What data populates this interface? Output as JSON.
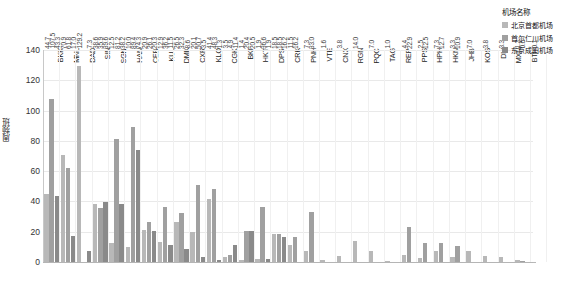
{
  "chart_data": {
    "type": "bar",
    "title": "",
    "xlabel": "",
    "ylabel": "周频班",
    "ylim": [
      0,
      140
    ],
    "yticks": [
      0,
      20,
      40,
      60,
      80,
      100,
      120,
      140
    ],
    "grid": true,
    "legend_position": "top-right",
    "legend_title": "机场名称",
    "categories": [
      "BKK",
      "MNL",
      "DAD",
      "SIN",
      "SGN",
      "HAN",
      "CEB",
      "KUL",
      "DMK",
      "CXR",
      "KLO",
      "CGK",
      "BKI",
      "HKT",
      "DPS",
      "CRK",
      "PNH",
      "VTE",
      "CNX",
      "RGN",
      "PQC",
      "TAG",
      "REP",
      "PPS",
      "HPH",
      "HKN",
      "JHB",
      "KOS",
      "DLI",
      "MXN",
      "BTH"
    ],
    "series": [
      {
        "name": "北京首都机场",
        "color": "#b8b8b8",
        "values": [
          44.7,
          70.9,
          129.2,
          38.6,
          12.5,
          10.0,
          20.9,
          12.9,
          26.5,
          20.1,
          41.4,
          3.5,
          1.4,
          1.9,
          18.5,
          11.5,
          7.3,
          1.6,
          3.8,
          14.0,
          7.0,
          1.0,
          4.4,
          2.5,
          7.3,
          3.3,
          7.0,
          3.8,
          3.3,
          1.2,
          0.1
        ]
      },
      {
        "name": "首尔仁川机场",
        "color": "#a0a0a0",
        "values": [
          107.5,
          61.8,
          0.0,
          35.9,
          81.2,
          89.4,
          26.1,
          36.2,
          32.3,
          50.7,
          48.3,
          4.9,
          20.4,
          36.6,
          18.5,
          16.2,
          33.0,
          0.0,
          0.0,
          0.0,
          0.0,
          0.0,
          22.9,
          12.5,
          12.7,
          10.9,
          0.0,
          0.0,
          0.0,
          0.6,
          0.0
        ]
      },
      {
        "name": "东京成田机场",
        "color": "#8a8a8a",
        "values": [
          43.3,
          17.0,
          7.3,
          39.6,
          38.2,
          74.3,
          20.3,
          11.5,
          8.6,
          3.5,
          1.3,
          11.4,
          20.5,
          1.9,
          16.2,
          0.0,
          0.0,
          0.0,
          0.0,
          0.0,
          0.0,
          0.0,
          0.0,
          0.0,
          0.0,
          0.0,
          0.0,
          0.0,
          0.0,
          0.0,
          0.0
        ]
      }
    ],
    "bar_labels": {
      "BKK": [
        "44.7",
        "107.5",
        "43.3"
      ],
      "MNL": [
        "70.9",
        "61.8",
        "17.0"
      ],
      "DAD": [
        "129.2",
        "",
        "7.3"
      ],
      "SIN": [
        "38.6",
        "35.9",
        "39.6"
      ],
      "SGN": [
        "12.5",
        "81.2",
        "38.2"
      ],
      "HAN": [
        "10.0",
        "89.4",
        "74.3"
      ],
      "CEB": [
        "20.9",
        "26.1",
        "20.3"
      ],
      "KUL": [
        "12.9",
        "36.2",
        "11.5"
      ],
      "DMK": [
        "26.5",
        "32.3",
        "8.6"
      ],
      "CXR": [
        "20.1",
        "50.7",
        "3.5"
      ],
      "KLO": [
        "41.4",
        "48.3",
        "1.3"
      ],
      "CGK": [
        "3.5",
        "4.9",
        "11.4"
      ],
      "BKI": [
        "1.4",
        "20.4",
        "20.5"
      ],
      "HKT": [
        "1.9",
        "36.6",
        "1.9"
      ],
      "DPS": [
        "18.5",
        "18.5",
        "16.2"
      ],
      "CRK": [
        "11.5",
        "16.2",
        ""
      ],
      "PNH": [
        "7.3",
        "33.0",
        ""
      ],
      "VTE": [
        "1.6",
        "",
        ""
      ],
      "CNX": [
        "3.8",
        "",
        ""
      ],
      "RGN": [
        "14.0",
        "",
        ""
      ],
      "PQC": [
        "7.0",
        "",
        ""
      ],
      "TAG": [
        "1.0",
        "",
        ""
      ],
      "REP": [
        "4.4",
        "22.9",
        ""
      ],
      "PPS": [
        "2.5",
        "12.5",
        ""
      ],
      "HPH": [
        "7.3",
        "12.7",
        ""
      ],
      "HKN": [
        "3.3",
        "10.9",
        ""
      ],
      "JHB": [
        "7.0",
        "",
        ""
      ],
      "KOS": [
        "3.8",
        "",
        ""
      ],
      "DLI": [
        "3.3",
        "",
        ""
      ],
      "MXN": [
        "1.2",
        "0.6",
        ""
      ],
      "BTH": [
        "0.1",
        "",
        ""
      ]
    }
  }
}
